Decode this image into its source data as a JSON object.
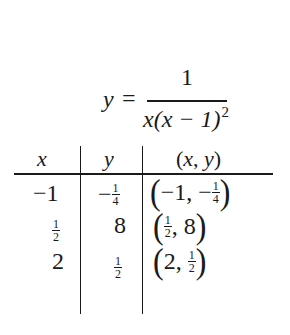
{
  "equation": {
    "lhs": "y",
    "equals": "=",
    "numerator": "1",
    "denominator_x": "x",
    "denominator_rest": "(x − 1)",
    "exponent": "2"
  },
  "table": {
    "headers": [
      "x",
      "y",
      "(x, y)"
    ],
    "rows": [
      {
        "x": {
          "sign": "−",
          "whole": "1"
        },
        "y": {
          "sign": "−",
          "num": "1",
          "den": "4"
        },
        "point": {
          "x": "−1",
          "y_sign": "−",
          "y_num": "1",
          "y_den": "4"
        }
      },
      {
        "x": {
          "num": "1",
          "den": "2"
        },
        "y": {
          "whole": "8"
        },
        "point": {
          "x_num": "1",
          "x_den": "2",
          "y": "8"
        }
      },
      {
        "x": {
          "whole": "2"
        },
        "y": {
          "num": "1",
          "den": "2"
        },
        "point": {
          "x": "2",
          "y_num": "1",
          "y_den": "2"
        }
      }
    ],
    "comma": ","
  }
}
